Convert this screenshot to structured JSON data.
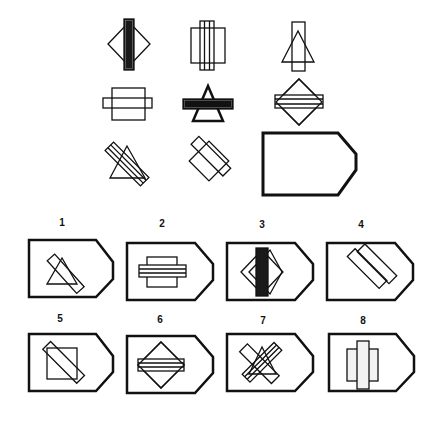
{
  "puzzle": {
    "type": "matrix-reasoning-3x3",
    "matrix_cells": [
      {
        "row": 1,
        "col": 1,
        "description": "diamond with dark filled vertical bar"
      },
      {
        "row": 1,
        "col": 2,
        "description": "square with vertical triple-stripe bar"
      },
      {
        "row": 1,
        "col": 3,
        "description": "triangle with vertical empty bar"
      },
      {
        "row": 2,
        "col": 1,
        "description": "square with horizontal empty bar"
      },
      {
        "row": 2,
        "col": 2,
        "description": "triangle with horizontal dark filled bar"
      },
      {
        "row": 2,
        "col": 3,
        "description": "diamond with horizontal triple-stripe bar"
      },
      {
        "row": 3,
        "col": 1,
        "description": "triangle with diagonal triple-stripe bar"
      },
      {
        "row": 3,
        "col": 2,
        "description": "tilted square with diagonal empty bar"
      },
      {
        "row": 3,
        "col": 3,
        "description": "empty answer slot (pentagon)"
      }
    ]
  },
  "options": [
    {
      "label": "1",
      "description": "triangle with diagonal bar"
    },
    {
      "label": "2",
      "description": "square with horizontal triple-stripe bar"
    },
    {
      "label": "3",
      "description": "diamond with dark vertical bar"
    },
    {
      "label": "4",
      "description": "two overlapping diagonal rectangles"
    },
    {
      "label": "5",
      "description": "square with diagonal bar"
    },
    {
      "label": "6",
      "description": "diamond with horizontal triple-stripe bar"
    },
    {
      "label": "7",
      "description": "crossed striped bars with triangle"
    },
    {
      "label": "8",
      "description": "square with vertical textured bar"
    }
  ],
  "colors": {
    "stroke": "#111111",
    "fill_dark": "#1a1a1a",
    "background": "#ffffff"
  }
}
